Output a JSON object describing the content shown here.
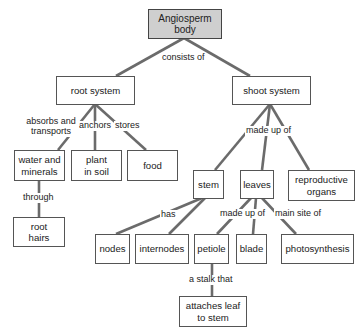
{
  "diagram": {
    "colors": {
      "root_fill": "#cfcfcf",
      "box_border": "#555555",
      "connector": "#6b6b6b",
      "background": "#ffffff"
    },
    "nodes": {
      "angiosperm": "Angiosperm body",
      "root_system": "root system",
      "shoot_system": "shoot system",
      "water_minerals": "water and minerals",
      "plant_in_soil": "plant in soil",
      "food": "food",
      "root_hairs": "root hairs",
      "stem": "stem",
      "leaves": "leaves",
      "reproductive_organs": "reproductive organs",
      "nodes": "nodes",
      "internodes": "internodes",
      "petiole": "petiole",
      "blade": "blade",
      "photosynthesis": "photosynthesis",
      "attaches": "attaches leaf to stem"
    },
    "links": {
      "consists_of": "consists of",
      "absorbs_transports": "absorbs and transports",
      "anchors": "anchors",
      "stores": "stores",
      "through": "through",
      "made_up_of_shoot": "made up of",
      "has": "has",
      "made_up_of_leaves": "made up of",
      "main_site_of": "main site of",
      "stalk_that": "a stalk that"
    },
    "edges": [
      {
        "from": "angiosperm",
        "to": "root_system",
        "label": "consists of"
      },
      {
        "from": "angiosperm",
        "to": "shoot_system",
        "label": "consists of"
      },
      {
        "from": "root_system",
        "to": "water_minerals",
        "label": "absorbs and transports"
      },
      {
        "from": "root_system",
        "to": "plant_in_soil",
        "label": "anchors"
      },
      {
        "from": "root_system",
        "to": "food",
        "label": "stores"
      },
      {
        "from": "water_minerals",
        "to": "root_hairs",
        "label": "through"
      },
      {
        "from": "shoot_system",
        "to": "stem",
        "label": "made up of"
      },
      {
        "from": "shoot_system",
        "to": "leaves",
        "label": "made up of"
      },
      {
        "from": "shoot_system",
        "to": "reproductive_organs",
        "label": "made up of"
      },
      {
        "from": "stem",
        "to": "nodes",
        "label": "has"
      },
      {
        "from": "stem",
        "to": "internodes",
        "label": "has"
      },
      {
        "from": "leaves",
        "to": "petiole",
        "label": "made up of"
      },
      {
        "from": "leaves",
        "to": "blade",
        "label": "made up of"
      },
      {
        "from": "leaves",
        "to": "photosynthesis",
        "label": "main site of"
      },
      {
        "from": "petiole",
        "to": "attaches",
        "label": "a stalk that"
      }
    ]
  }
}
